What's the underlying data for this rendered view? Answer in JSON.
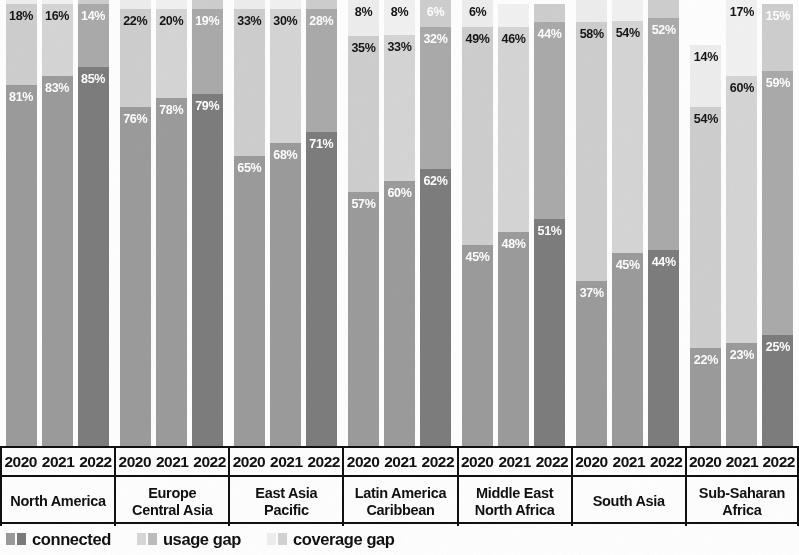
{
  "chart_data": {
    "type": "bar",
    "subtype": "stacked-100-percent",
    "title": "",
    "xlabel": "",
    "ylabel": "",
    "ylim": [
      0,
      100
    ],
    "grid": false,
    "legend_position": "bottom-left",
    "categories": [
      "North America",
      "Europe Central Asia",
      "East Asia Pacific",
      "Latin America Caribbean",
      "Middle East North Africa",
      "South Asia",
      "Sub-Saharan Africa"
    ],
    "years": [
      "2020",
      "2021",
      "2022"
    ],
    "series": [
      {
        "name": "connected",
        "values": [
          [
            81,
            83,
            85
          ],
          [
            76,
            78,
            79
          ],
          [
            65,
            68,
            71
          ],
          [
            57,
            60,
            62
          ],
          [
            45,
            48,
            51
          ],
          [
            37,
            45,
            44
          ],
          [
            22,
            23,
            25
          ]
        ]
      },
      {
        "name": "usage gap",
        "values": [
          [
            18,
            16,
            14
          ],
          [
            22,
            20,
            19
          ],
          [
            33,
            30,
            28
          ],
          [
            35,
            33,
            32
          ],
          [
            49,
            46,
            44
          ],
          [
            58,
            54,
            52
          ],
          [
            54,
            60,
            59
          ]
        ]
      },
      {
        "name": "coverage gap",
        "values": [
          [
            1,
            1,
            1
          ],
          [
            2,
            2,
            2
          ],
          [
            2,
            2,
            2
          ],
          [
            8,
            8,
            6
          ],
          [
            6,
            5,
            4
          ],
          [
            5,
            5,
            4
          ],
          [
            14,
            17,
            15
          ]
        ]
      }
    ]
  },
  "legend": {
    "items": [
      {
        "label": "connected",
        "swatch_light": "#9b9b9b",
        "swatch_dark": "#7b7b7b"
      },
      {
        "label": "usage gap",
        "swatch_light": "#d8d8d8",
        "swatch_dark": "#bdbdbd"
      },
      {
        "label": "coverage gap",
        "swatch_light": "#efefef",
        "swatch_dark": "#d3d3d3"
      }
    ]
  },
  "colors": {
    "connected_2020": "#9c9c9c",
    "connected_2021": "#9c9c9c",
    "connected_2022": "#7d7d7d",
    "usage_2020": "#cfcfcf",
    "usage_2021": "#d6d6d6",
    "usage_2022": "#ababab",
    "coverage_2020": "#eeeeee",
    "coverage_2021": "#f2f2f2",
    "coverage_2022": "#cfcfcf",
    "axis_line": "#111111",
    "label_dark": "#161616",
    "label_light": "#ffffff",
    "background": "#ffffff"
  },
  "axis": {
    "groups": [
      {
        "years": [
          "2020",
          "2021",
          "2022"
        ],
        "lines": [
          "North America"
        ]
      },
      {
        "years": [
          "2020",
          "2021",
          "2022"
        ],
        "lines": [
          "Europe",
          "Central Asia"
        ]
      },
      {
        "years": [
          "2020",
          "2021",
          "2022"
        ],
        "lines": [
          "East Asia",
          "Pacific"
        ]
      },
      {
        "years": [
          "2020",
          "2021",
          "2022"
        ],
        "lines": [
          "Latin America",
          "Caribbean"
        ]
      },
      {
        "years": [
          "2020",
          "2021",
          "2022"
        ],
        "lines": [
          "Middle East",
          "North Africa"
        ]
      },
      {
        "years": [
          "2020",
          "2021",
          "2022"
        ],
        "lines": [
          "South Asia"
        ]
      },
      {
        "years": [
          "2020",
          "2021",
          "2022"
        ],
        "lines": [
          "Sub-Saharan",
          "Africa"
        ]
      }
    ]
  }
}
